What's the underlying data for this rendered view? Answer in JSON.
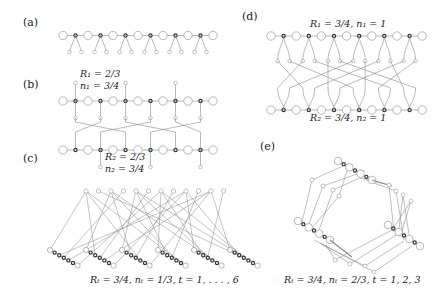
{
  "panels": {
    "a": {
      "label": "(a)"
    },
    "b": {
      "label": "(b)",
      "r1": "R₁ = 2/3",
      "n1": "n₁ = 3/4",
      "r2": "R₂ = 2/3",
      "n2": "n₂ = 3/4"
    },
    "c": {
      "label": "(c)",
      "caption": "Rₜ = 3/4, nₜ = 1/3, t = 1, . . . , 6"
    },
    "d": {
      "label": "(d)",
      "top": "R₁ = 3/4, n₁ = 1",
      "bottom": "R₂ = 3/4, n₂ = 1"
    },
    "e": {
      "label": "(e)",
      "caption": "Rₜ = 3/4, nₜ = 2/3, t = 1, 2, 3"
    }
  },
  "colors": {
    "line": "#8a8a8a",
    "node_stroke": "#9a9a9a",
    "dark_node": "#333333",
    "text": "#222222"
  }
}
